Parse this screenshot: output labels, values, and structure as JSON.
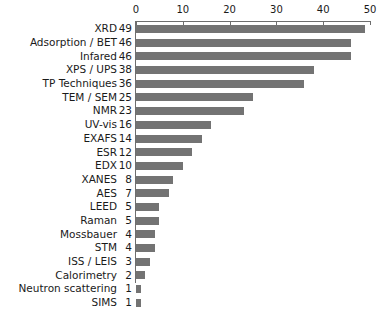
{
  "chart_data": {
    "type": "bar",
    "orientation": "horizontal",
    "title": "",
    "subtitle": "",
    "xlabel": "",
    "ylabel": "",
    "xlim": [
      0,
      50
    ],
    "xticks": [
      0,
      10,
      20,
      30,
      40,
      50
    ],
    "xtick_labels": [
      "0",
      "10",
      "20",
      "30",
      "40",
      "50"
    ],
    "grid": false,
    "legend": false,
    "bar_color": "#737373",
    "axis_color": "#6e6e6e",
    "background": "#ffffff",
    "categories": [
      "XRD",
      "Adsorption / BET",
      "Infared",
      "XPS / UPS",
      "TP Techniques",
      "TEM / SEM",
      "NMR",
      "UV-vis",
      "EXAFS",
      "ESR",
      "EDX",
      "XANES",
      "AES",
      "LEED",
      "Raman",
      "Mossbauer",
      "STM",
      "ISS / LEIS",
      "Calorimetry",
      "Neutron scattering",
      "SIMS"
    ],
    "values": [
      49,
      46,
      46,
      38,
      36,
      25,
      23,
      16,
      14,
      12,
      10,
      8,
      7,
      5,
      5,
      4,
      4,
      3,
      2,
      1,
      1
    ],
    "value_labels": [
      "49",
      "46",
      "46",
      "38",
      "36",
      "25",
      "23",
      "16",
      "14",
      "12",
      "10",
      "8",
      "7",
      "5",
      "5",
      "4",
      "4",
      "3",
      "2",
      "1",
      "1"
    ]
  }
}
